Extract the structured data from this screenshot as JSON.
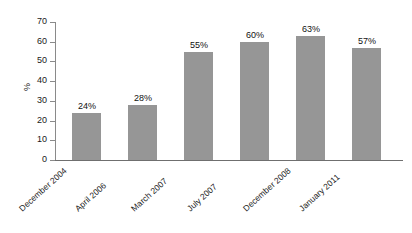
{
  "chart_data": {
    "type": "bar",
    "title": "",
    "subtitle": "",
    "xlabel": "",
    "ylabel": "%",
    "categories": [
      "December 2004",
      "April 2006",
      "March 2007",
      "July 2007",
      "December 2008",
      "January 2011"
    ],
    "values": [
      24,
      28,
      55,
      60,
      63,
      57
    ],
    "data_labels": [
      "24%",
      "28%",
      "55%",
      "60%",
      "63%",
      "57%"
    ],
    "ylim": [
      0,
      70
    ],
    "ytick_values": [
      70,
      60,
      50,
      40,
      30,
      20,
      10,
      0
    ],
    "ytick_labels": [
      "70",
      "60",
      "50",
      "40",
      "30",
      "20",
      "10",
      "0"
    ],
    "grid": false,
    "legend": null,
    "legend_position": "none",
    "series": [
      {
        "name": "",
        "values": [
          24,
          28,
          55,
          60,
          63,
          57
        ],
        "color": "#969696"
      }
    ],
    "colors": {
      "bar_fill": "#969696",
      "axis": "#8a8a8a",
      "text": "#1a1a1a",
      "background": "#ffffff"
    }
  }
}
